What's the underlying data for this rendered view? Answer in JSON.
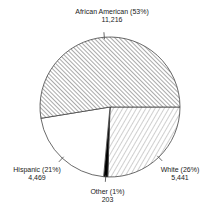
{
  "chart_data": {
    "type": "pie",
    "title": "",
    "start_angle_deg": 0,
    "direction": "clockwise",
    "slices": [
      {
        "name": "White",
        "value": 5441,
        "percent": 26,
        "label": "White (26%)",
        "value_label": "5,441",
        "fill": "hatch-light-forward"
      },
      {
        "name": "Other",
        "value": 203,
        "percent": 1,
        "label": "Other (1%)",
        "value_label": "203",
        "fill": "#000000"
      },
      {
        "name": "Hispanic",
        "value": 4469,
        "percent": 21,
        "label": "Hispanic (21%)",
        "value_label": "4,469",
        "fill": "#ffffff"
      },
      {
        "name": "African American",
        "value": 11216,
        "percent": 53,
        "label": "African American (53%)",
        "value_label": "11,216",
        "fill": "hatch-dense-back"
      }
    ],
    "legend": "none (direct labels with leader ticks)"
  },
  "labels": {
    "african_american": {
      "name": "African American (53%)",
      "value": "11,216"
    },
    "white": {
      "name": "White (26%)",
      "value": "5,441"
    },
    "hispanic": {
      "name": "Hispanic (21%)",
      "value": "4,469"
    },
    "other": {
      "name": "Other (1%)",
      "value": "203"
    }
  },
  "colors": {
    "outline": "#444444",
    "hatch": "#555555",
    "background": "#ffffff"
  }
}
